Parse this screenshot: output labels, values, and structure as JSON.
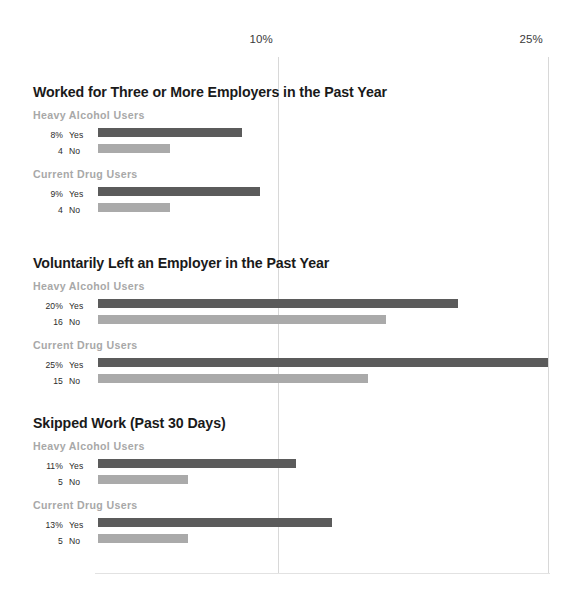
{
  "chart_data": {
    "type": "bar",
    "orientation": "horizontal",
    "title": "",
    "xlabel": "",
    "ylabel": "",
    "xlim": [
      0,
      26.0
    ],
    "grid": true,
    "legend": "none",
    "axis_ticks": [
      {
        "label": "10%",
        "value": 10
      },
      {
        "label": "25%",
        "value": 25
      }
    ],
    "value_unit": "%",
    "colors": {
      "yes_bar": "#5b5b5b",
      "no_bar": "#aaaaaa",
      "gridline": "#d8d8d8",
      "group_label": "#a8a8a8",
      "title": "#1a1a1a"
    },
    "sections": [
      {
        "title": "Worked for Three or More Employers in the Past Year",
        "groups": [
          {
            "label": "Heavy Alcohol Users",
            "bars": [
              {
                "value_label": "8%",
                "category": "Yes",
                "value": 8,
                "series": "yes"
              },
              {
                "value_label": "4",
                "category": "No",
                "value": 4,
                "series": "no"
              }
            ]
          },
          {
            "label": "Current Drug Users",
            "bars": [
              {
                "value_label": "9%",
                "category": "Yes",
                "value": 9,
                "series": "yes"
              },
              {
                "value_label": "4",
                "category": "No",
                "value": 4,
                "series": "no"
              }
            ]
          }
        ]
      },
      {
        "title": "Voluntarily Left an Employer in the Past Year",
        "groups": [
          {
            "label": "Heavy Alcohol Users",
            "bars": [
              {
                "value_label": "20%",
                "category": "Yes",
                "value": 20,
                "series": "yes"
              },
              {
                "value_label": "16",
                "category": "No",
                "value": 16,
                "series": "no"
              }
            ]
          },
          {
            "label": "Current Drug Users",
            "bars": [
              {
                "value_label": "25%",
                "category": "Yes",
                "value": 25,
                "series": "yes"
              },
              {
                "value_label": "15",
                "category": "No",
                "value": 15,
                "series": "no"
              }
            ]
          }
        ]
      },
      {
        "title": "Skipped Work (Past 30 Days)",
        "groups": [
          {
            "label": "Heavy Alcohol Users",
            "bars": [
              {
                "value_label": "11%",
                "category": "Yes",
                "value": 11,
                "series": "yes"
              },
              {
                "value_label": "5",
                "category": "No",
                "value": 5,
                "series": "no"
              }
            ]
          },
          {
            "label": "Current Drug Users",
            "bars": [
              {
                "value_label": "13%",
                "category": "Yes",
                "value": 13,
                "series": "yes"
              },
              {
                "value_label": "5",
                "category": "No",
                "value": 5,
                "series": "no"
              }
            ]
          }
        ]
      }
    ]
  },
  "layout": {
    "section_tops": [
      84,
      255,
      415
    ],
    "plot_left_px": 98,
    "px_per_percent": 18.0
  }
}
